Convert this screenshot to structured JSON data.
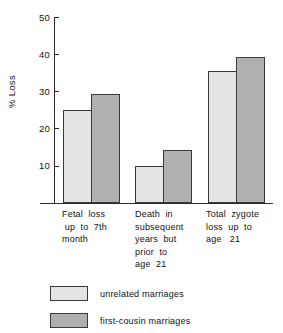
{
  "chart_data": {
    "type": "bar",
    "title": "",
    "xlabel": "",
    "ylabel": "% Loss",
    "ylim": [
      0,
      50
    ],
    "yticks": [
      10,
      20,
      30,
      40,
      50
    ],
    "ytick_labels": [
      "10",
      "20",
      "30",
      "40",
      "50"
    ],
    "grid": false,
    "legend_position": "below-plot-left",
    "categories": [
      "Fetal loss up to 7th month",
      "Death in subsequent years but prior to age 21",
      "Total zygote loss up to age 21"
    ],
    "category_label_lines": [
      [
        "Fetal  loss",
        " up  to  7th",
        "month"
      ],
      [
        "Death  in",
        "subsequent",
        "years  but",
        "prior  to",
        "age  21"
      ],
      [
        "Total  zygote",
        "loss  up  to",
        "age   21"
      ]
    ],
    "series": [
      {
        "name": "unrelated marriages",
        "color": "#e4e4e4",
        "values": [
          25.0,
          10.0,
          35.5
        ]
      },
      {
        "name": "first-cousin marriages",
        "color": "#b0b0b0",
        "values": [
          29.3,
          14.3,
          39.3
        ]
      }
    ]
  },
  "axis": {
    "y_title": "% Loss",
    "ticks": [
      {
        "label": "50",
        "value": 50
      },
      {
        "label": "40",
        "value": 40
      },
      {
        "label": "30",
        "value": 30
      },
      {
        "label": "20",
        "value": 20
      },
      {
        "label": "10",
        "value": 10
      }
    ]
  },
  "categories": [
    {
      "id": "fetal-loss",
      "lines": [
        "Fetal  loss",
        " up  to  7th",
        "month"
      ]
    },
    {
      "id": "death-subsequent",
      "lines": [
        "Death  in",
        "subsequent",
        "years  but",
        "prior  to",
        "age  21"
      ]
    },
    {
      "id": "total-zygote",
      "lines": [
        "Total  zygote",
        "loss  up  to",
        "age   21"
      ]
    }
  ],
  "legend": {
    "items": [
      {
        "id": "unrelated",
        "label": "unrelated   marriages",
        "color": "#e4e4e4"
      },
      {
        "id": "first-cousin",
        "label": "first-cousin   marriages",
        "color": "#b0b0b0"
      }
    ]
  },
  "colors": {
    "unrelated_fill": "#e4e4e4",
    "first_cousin_fill": "#b0b0b0",
    "bar_stroke": "#3a3a3a",
    "axis": "#2b2b2b",
    "background": "#ffffff"
  }
}
